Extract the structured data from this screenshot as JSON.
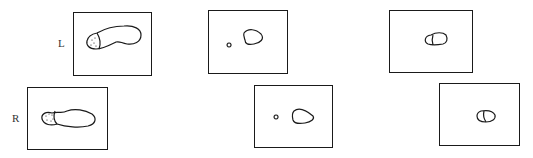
{
  "figure": {
    "rows": [
      {
        "label": "L",
        "side": "left"
      },
      {
        "label": "R",
        "side": "right"
      }
    ],
    "panels": [
      {
        "row": "L",
        "stage": 1,
        "content": "full footprint with dotted heel"
      },
      {
        "row": "L",
        "stage": 2,
        "content": "small heel dot and toe pad"
      },
      {
        "row": "L",
        "stage": 3,
        "content": "segmented pad"
      },
      {
        "row": "R",
        "stage": 1,
        "content": "full footprint with dotted heel"
      },
      {
        "row": "R",
        "stage": 2,
        "content": "small heel dot and toe pad"
      },
      {
        "row": "R",
        "stage": 3,
        "content": "segmented pad"
      }
    ],
    "colors": {
      "stroke": "#1a1a1a",
      "background": "#ffffff"
    }
  }
}
